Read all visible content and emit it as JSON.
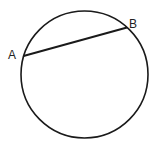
{
  "diagram": {
    "type": "circle-with-chord",
    "points": [
      {
        "label": "A"
      },
      {
        "label": "B"
      }
    ],
    "chord": "AB",
    "colors": {
      "stroke": "#1a1a1a",
      "background": "#ffffff"
    }
  }
}
